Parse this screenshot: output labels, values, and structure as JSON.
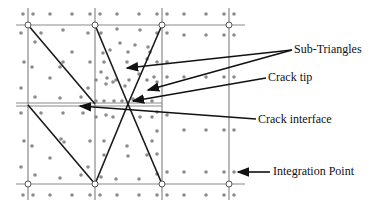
{
  "figure": {
    "type": "XFEM crack element diagram",
    "labels": {
      "sub_triangles": "Sub-Triangles",
      "crack_tip": "Crack tip",
      "crack_interface": "Crack interface",
      "integration_point": "Integration Point"
    },
    "colors": {
      "grid": "#8a8a8a",
      "triangle_edges": "#1a1a1a",
      "points": "#8c8c8c",
      "arrows": "#111111",
      "text": "#111111"
    }
  }
}
